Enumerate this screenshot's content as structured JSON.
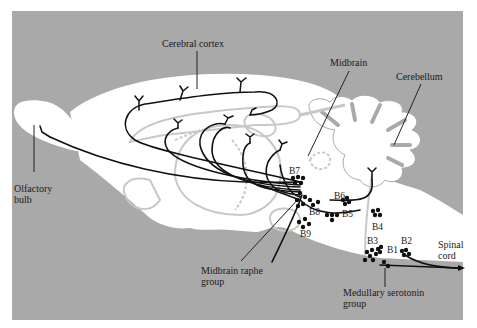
{
  "figure": {
    "colors": {
      "background": "#a9a9a9",
      "brain": "#ffffff",
      "pathway": "#111111",
      "outline": "#c8c8c8"
    }
  },
  "labels": {
    "cerebral_cortex": "Cerebral cortex",
    "midbrain": "Midbrain",
    "cerebellum": "Cerebellum",
    "olfactory_bulb_1": "Olfactory",
    "olfactory_bulb_2": "bulb",
    "spinal_cord_1": "Spinal",
    "spinal_cord_2": "cord",
    "midbrain_raphe_1": "Midbrain raphe",
    "midbrain_raphe_2": "group",
    "medullary_1": "Medullary serotonin",
    "medullary_2": "group"
  },
  "nuclei": {
    "B1": "B1",
    "B2": "B2",
    "B3": "B3",
    "B4": "B4",
    "B5": "B5",
    "B6": "B6",
    "B7": "B7",
    "B8": "B8",
    "B9": "B9"
  }
}
